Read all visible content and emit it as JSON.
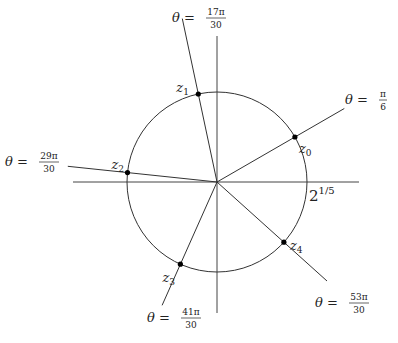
{
  "diagram": {
    "center": {
      "x": 217,
      "y": 182
    },
    "radius": 90,
    "axes": {
      "horizontal": {
        "x1": 73,
        "x2": 359,
        "y": 182
      },
      "vertical": {
        "x": 217,
        "y1": 36,
        "y2": 313
      }
    },
    "radius_label": {
      "base": "2",
      "exponent": "1/5"
    },
    "colors": {
      "line": "#333333",
      "axis": "#444444",
      "point": "#000000",
      "text": "#222222"
    },
    "roots": [
      {
        "name": "z",
        "sub": "0",
        "angle_label": {
          "prefix": "θ = ",
          "num": "π",
          "den": "6"
        },
        "angle_deg": 30,
        "ray_len": 147
      },
      {
        "name": "z",
        "sub": "1",
        "angle_label": {
          "prefix": "θ = ",
          "num": "17π",
          "den": "30"
        },
        "angle_deg": 102,
        "ray_len": 167
      },
      {
        "name": "z",
        "sub": "2",
        "angle_label": {
          "prefix": "θ = ",
          "num": "29π",
          "den": "30"
        },
        "angle_deg": 174,
        "ray_len": 150
      },
      {
        "name": "z",
        "sub": "3",
        "angle_label": {
          "prefix": "θ = ",
          "num": "41π",
          "den": "30"
        },
        "angle_deg": 246,
        "ray_len": 135
      },
      {
        "name": "z",
        "sub": "4",
        "angle_label": {
          "prefix": "θ = ",
          "num": "53π",
          "den": "30"
        },
        "angle_deg": 318,
        "ray_len": 148
      }
    ]
  }
}
